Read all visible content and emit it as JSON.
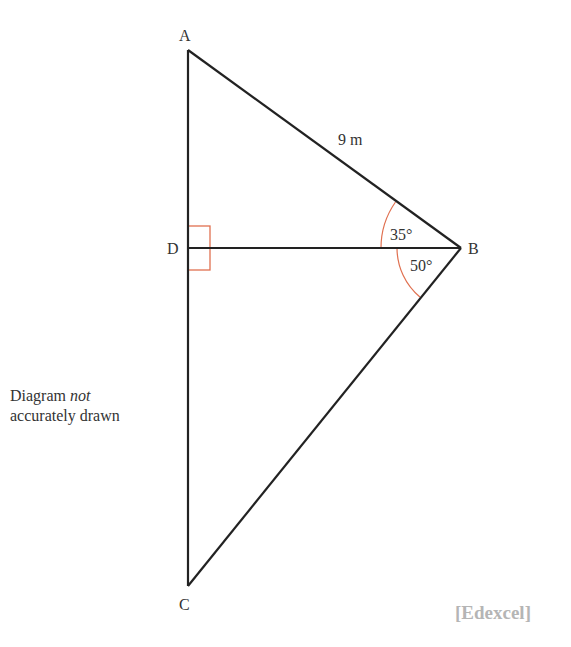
{
  "diagram": {
    "type": "geometry-triangle",
    "vertices": {
      "A": {
        "label": "A",
        "x": 188,
        "y": 50
      },
      "B": {
        "label": "B",
        "x": 461,
        "y": 248
      },
      "C": {
        "label": "C",
        "x": 188,
        "y": 586
      },
      "D": {
        "label": "D",
        "x": 188,
        "y": 248
      }
    },
    "edges": [
      {
        "from": "A",
        "to": "B",
        "label": "9 m"
      },
      {
        "from": "B",
        "to": "C"
      },
      {
        "from": "A",
        "to": "C"
      },
      {
        "from": "D",
        "to": "B"
      }
    ],
    "angles": [
      {
        "at": "B",
        "between": "AB-DB",
        "label": "35°"
      },
      {
        "at": "B",
        "between": "DB-CB",
        "label": "50°"
      }
    ],
    "right_angle": {
      "at": "D"
    },
    "colors": {
      "line": "#222222",
      "marker": "#e07050",
      "text": "#333333",
      "source": "#b5b5b5"
    }
  },
  "labels": {
    "A": "A",
    "B": "B",
    "C": "C",
    "D": "D",
    "side_ab": "9 m",
    "angle_top": "35°",
    "angle_bottom": "50°"
  },
  "note": {
    "line1_prefix": "Diagram ",
    "line1_italic": "not",
    "line2": "accurately drawn"
  },
  "source": "[Edexcel]"
}
